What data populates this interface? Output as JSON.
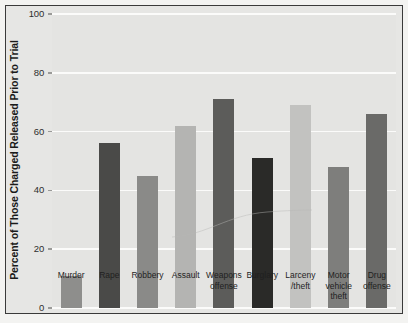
{
  "chart_data": {
    "type": "bar",
    "title": "",
    "xlabel": "",
    "ylabel": "Percent of Those Charged Released Prior to Trial",
    "ylim": [
      0,
      100
    ],
    "yticks": [
      0,
      20,
      40,
      60,
      80,
      100
    ],
    "ytick_labels": [
      "0",
      "20",
      "40",
      "60",
      "80",
      "100"
    ],
    "grid": true,
    "legend": "none",
    "categories": [
      "Murder",
      "Rape",
      "Robbery",
      "Assault",
      "Weapons\noffense",
      "Burglary",
      "Larceny\n/theft",
      "Motor\nvehicle\ntheft",
      "Drug\noffense"
    ],
    "category_lines": [
      [
        "Murder"
      ],
      [
        "Rape"
      ],
      [
        "Robbery"
      ],
      [
        "Assault"
      ],
      [
        "Weapons",
        "offense"
      ],
      [
        "Burglary"
      ],
      [
        "Larceny",
        "/theft"
      ],
      [
        "Motor",
        "vehicle",
        "theft"
      ],
      [
        "Drug",
        "offense"
      ]
    ],
    "values": [
      11,
      56,
      45,
      62,
      71,
      51,
      69,
      48,
      66
    ],
    "bar_colors": [
      "#8e8e8c",
      "#4a4a48",
      "#8a8a88",
      "#b4b4b2",
      "#5c5c5a",
      "#2a2a28",
      "#c2c2c0",
      "#7e7e7c",
      "#6a6a68"
    ]
  },
  "style": {
    "plot_background": "#e4e4e2",
    "page_background": "#f3f3f1",
    "gridline_color": "#fbfbfa",
    "frame_color": "#3a3a3a",
    "text_color": "#1f1f1f"
  }
}
